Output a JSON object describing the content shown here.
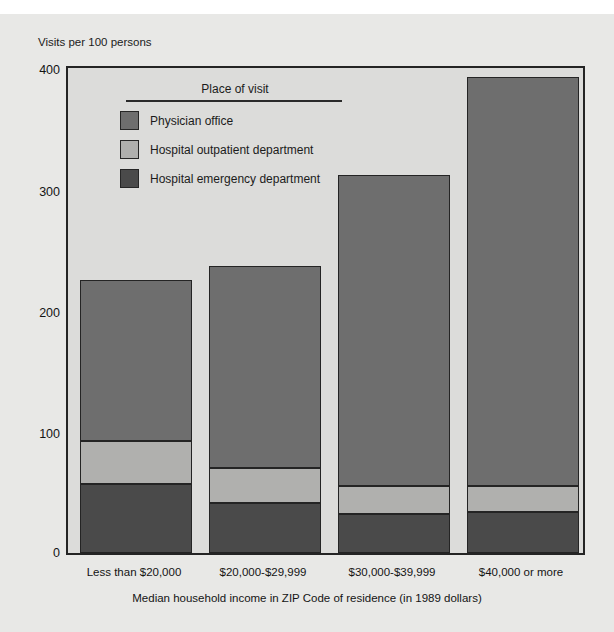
{
  "chart_data": {
    "type": "bar",
    "subtype": "stacked",
    "title": "",
    "ylabel": "Visits per 100 persons",
    "xlabel": "Median household income in ZIP Code of residence (in 1989 dollars)",
    "categories": [
      "Less than $20,000",
      "$20,000-$29,999",
      "$30,000-$39,999",
      "$40,000 or more"
    ],
    "ylim": [
      0,
      400
    ],
    "yticks": [
      0,
      100,
      200,
      300,
      400
    ],
    "ytick_labels": [
      "0",
      "100",
      "200",
      "300",
      "400"
    ],
    "grid": false,
    "legend_position": "inside-top-left",
    "legend_title": "Place of visit",
    "series": [
      {
        "name": "Hospital emergency department",
        "color": "#4a4a4a",
        "values": [
          57,
          41,
          32,
          34
        ]
      },
      {
        "name": "Hospital outpatient department",
        "color": "#b0b0ae",
        "values": [
          35,
          29,
          23,
          21
        ]
      },
      {
        "name": "Physician office",
        "color": "#6e6e6e",
        "values": [
          133,
          167,
          257,
          338
        ]
      }
    ],
    "totals": [
      225,
      237,
      312,
      393
    ],
    "colors": {
      "physician_office": "#6e6e6e",
      "hospital_outpatient": "#b0b0ae",
      "hospital_emergency": "#4a4a4a",
      "plot_background": "#dcdcda",
      "figure_background": "#e8e8e6",
      "axis": "#242424"
    }
  },
  "legend": {
    "title": "Place of visit",
    "entries": [
      {
        "label": "Physician office",
        "color": "#6e6e6e"
      },
      {
        "label": "Hospital outpatient department",
        "color": "#b0b0ae"
      },
      {
        "label": "Hospital emergency department",
        "color": "#4a4a4a"
      }
    ]
  },
  "axes": {
    "y_title": "Visits per 100 persons",
    "y_ticks": {
      "t400": "400",
      "t300": "300",
      "t200": "200",
      "t100": "100",
      "t0": "0"
    },
    "x_title": "Median household income in ZIP Code of residence (in 1989 dollars)",
    "x_ticks": [
      "Less than $20,000",
      "$20,000-$29,999",
      "$30,000-$39,999",
      "$40,000 or more"
    ]
  }
}
